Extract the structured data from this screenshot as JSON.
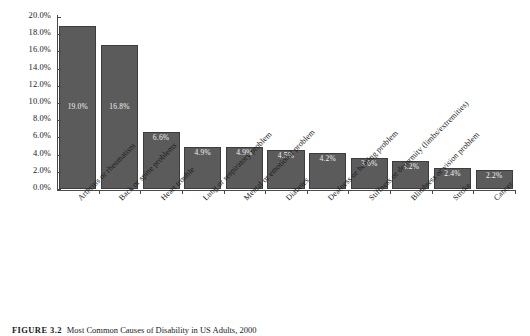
{
  "caption": {
    "figure_number": "FIGURE 3.2",
    "text": "Most Common Causes of Disability in US Adults, 2000"
  },
  "chart_data": {
    "type": "bar",
    "title": "",
    "xlabel": "",
    "ylabel": "",
    "ylim": [
      0,
      20
    ],
    "yunit": "%",
    "grid": false,
    "legend": "none",
    "orientation": "vertical",
    "bar_color": "#5b5b5b",
    "bar_edge_color": "#3d3d3d",
    "label_color": "#f2f2f2",
    "categories": [
      "Arthritis or rheumatism",
      "Back or spine problems",
      "Heart trouble",
      "Lung or respiratory problem",
      "Mental or emotional problem",
      "Diabetes",
      "Deafness or hearing problem",
      "Stiffness or deformity (limbs/extremities)",
      "Blindness or vision problem",
      "Stroke",
      "Cancer"
    ],
    "values": [
      19.0,
      16.8,
      6.6,
      4.9,
      4.9,
      4.5,
      4.2,
      3.6,
      3.2,
      2.4,
      2.2
    ],
    "data_labels": [
      "19.0%",
      "16.8%",
      "6.6%",
      "4.9%",
      "4.9%",
      "4.5%",
      "4.2%",
      "3.6%",
      "3.2%",
      "2.4%",
      "2.2%"
    ],
    "ytick_values": [
      0,
      2,
      4,
      6,
      8,
      10,
      12,
      14,
      16,
      18,
      20
    ],
    "ytick_labels": [
      "0.0%",
      "2.0%",
      "4.0%",
      "6.0%",
      "8.0%",
      "10.0%",
      "12.0%",
      "14.0%",
      "16.0%",
      "18.0%",
      "20.0%"
    ]
  }
}
